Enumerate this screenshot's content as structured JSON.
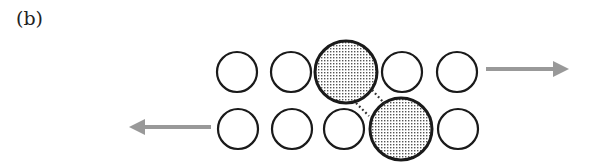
{
  "panel_label": "(b)",
  "colors": {
    "circle_stroke": "#1a1a1a",
    "arrow": "#999999",
    "stipple": "#555555",
    "background": "#ffffff"
  },
  "top_row": {
    "y": 72,
    "circles": [
      {
        "cx": 237,
        "r": 20,
        "type": "small"
      },
      {
        "cx": 291,
        "r": 20,
        "type": "small"
      },
      {
        "cx": 346,
        "r": 31,
        "type": "large-stippled"
      },
      {
        "cx": 402,
        "r": 20,
        "type": "small"
      },
      {
        "cx": 457,
        "r": 20,
        "type": "small"
      }
    ],
    "arrow": {
      "direction": "right",
      "x1": 486,
      "x2": 569,
      "y": 69
    }
  },
  "bottom_row": {
    "y": 129,
    "circles": [
      {
        "cx": 238,
        "r": 20,
        "type": "small"
      },
      {
        "cx": 292,
        "r": 20,
        "type": "small"
      },
      {
        "cx": 344,
        "r": 20,
        "type": "small"
      },
      {
        "cx": 401,
        "r": 31,
        "type": "large-stippled"
      },
      {
        "cx": 458,
        "r": 20,
        "type": "small"
      }
    ],
    "arrow": {
      "direction": "left",
      "x1": 211,
      "x2": 129,
      "y": 127
    }
  },
  "connectors": [
    {
      "style": "dotted",
      "x1": 372,
      "y1": 90,
      "x2": 385,
      "y2": 104
    },
    {
      "style": "dotted",
      "x1": 356,
      "y1": 103,
      "x2": 369,
      "y2": 116
    }
  ]
}
